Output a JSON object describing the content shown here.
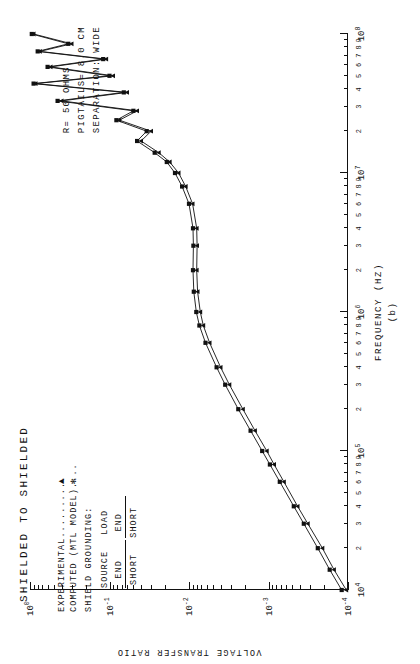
{
  "plot": {
    "title": "SHIELDED TO SHIELDED",
    "panel_id": "(b)",
    "xaxis_title": "FREQUENCY (HZ)",
    "yaxis_title": "VOLTAGE TRANSFER RATIO"
  },
  "legend": {
    "experimental_label": "EXPERIMENTAL..........",
    "experimental_marker": "▲",
    "computed_label": "COMPUTED (MTL MODEL)....",
    "computed_marker": "✻",
    "grounding_header": "SHIELD GROUNDING:",
    "col_source": "SOURCE",
    "col_source_sub": "END",
    "col_load": "LOAD",
    "col_load_sub": "END",
    "val_source": "SHORT",
    "val_load": "SHORT"
  },
  "annotations": {
    "resistance": "R= 50   OHMS",
    "pigtails": "PIGTAILS=  8.0  CM",
    "separation": "SEPARATION: WIDE"
  },
  "chart_data": {
    "type": "line",
    "title": "SHIELDED TO SHIELDED",
    "xlabel": "FREQUENCY (HZ)",
    "ylabel": "VOLTAGE TRANSFER RATIO",
    "xscale": "log",
    "yscale": "log",
    "xlim": [
      10000,
      100000000
    ],
    "ylim": [
      0.0001,
      1
    ],
    "x_decade_labels": [
      "10⁴",
      "10⁵",
      "10⁶",
      "10⁷",
      "10⁸"
    ],
    "x_minor_labels": [
      "2",
      "3",
      "4",
      "5",
      "6",
      "7",
      "8",
      "9"
    ],
    "y_decade_labels": [
      "10⁰",
      "10⁻¹",
      "10⁻²",
      "10⁻³",
      "10⁻⁴"
    ],
    "grid": false,
    "legend_position": "upper-left",
    "series": [
      {
        "name": "EXPERIMENTAL",
        "marker": "triangle",
        "x": [
          10000,
          14000,
          20000,
          30000,
          40000,
          60000,
          80000,
          100000,
          140000,
          200000,
          300000,
          400000,
          600000,
          800000,
          1000000,
          1400000,
          2000000,
          3000000,
          4000000,
          6000000,
          8000000,
          10000000,
          12000000,
          14000000,
          17000000,
          20000000,
          24000000,
          28000000,
          33000000,
          38000000,
          44000000,
          50000000,
          58000000,
          66000000,
          75000000,
          85000000,
          100000000
        ],
        "y": [
          0.000105,
          0.00015,
          0.00021,
          0.00032,
          0.00043,
          0.00064,
          0.00085,
          0.00105,
          0.00148,
          0.0021,
          0.0031,
          0.004,
          0.0055,
          0.0066,
          0.0072,
          0.0078,
          0.008,
          0.0079,
          0.008,
          0.009,
          0.011,
          0.0135,
          0.0175,
          0.024,
          0.04,
          0.03,
          0.075,
          0.045,
          0.4,
          0.06,
          0.85,
          0.09,
          0.55,
          0.11,
          0.75,
          0.3,
          0.9
        ]
      },
      {
        "name": "COMPUTED (MTL MODEL)",
        "marker": "asterisk",
        "x": [
          10000,
          14000,
          20000,
          30000,
          40000,
          60000,
          80000,
          100000,
          140000,
          200000,
          300000,
          400000,
          600000,
          800000,
          1000000,
          1400000,
          2000000,
          3000000,
          4000000,
          6000000,
          8000000,
          10000000,
          12000000,
          14000000,
          17000000,
          20000000,
          24000000,
          28000000,
          33000000,
          38000000,
          44000000,
          50000000,
          58000000,
          66000000,
          75000000,
          85000000,
          100000000
        ],
        "x_note": "Computed curve lies slightly above experimental over 10^4 - 10^7 Hz",
        "y": [
          0.00012,
          0.00017,
          0.00024,
          0.00036,
          0.00048,
          0.00072,
          0.00096,
          0.0012,
          0.00168,
          0.0024,
          0.0035,
          0.0045,
          0.0062,
          0.0074,
          0.0081,
          0.0087,
          0.0089,
          0.0088,
          0.0089,
          0.01,
          0.0122,
          0.015,
          0.019,
          0.027,
          0.045,
          0.034,
          0.082,
          0.05,
          0.45,
          0.066,
          0.9,
          0.1,
          0.6,
          0.12,
          0.8,
          0.33,
          0.95
        ]
      }
    ]
  }
}
